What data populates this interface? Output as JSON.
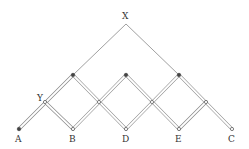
{
  "diagram": {
    "labels": {
      "X": "X",
      "Y": "Y",
      "A": "A",
      "B": "B",
      "D": "D",
      "E": "E",
      "C": "C"
    },
    "points": [
      {
        "id": "X",
        "label": "X"
      },
      {
        "id": "Y",
        "label": "Y"
      },
      {
        "id": "A",
        "label": "A"
      },
      {
        "id": "B",
        "label": "B"
      },
      {
        "id": "D",
        "label": "D"
      },
      {
        "id": "E",
        "label": "E"
      },
      {
        "id": "C",
        "label": "C"
      }
    ],
    "colors": {
      "line": "#777777",
      "bar": "#888888",
      "pin": "#444444"
    }
  }
}
